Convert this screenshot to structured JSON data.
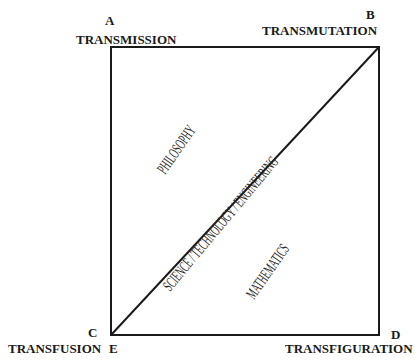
{
  "corners": {
    "A": {
      "letter": "A",
      "label": "TRANSMISSION"
    },
    "B": {
      "letter": "B",
      "label": "TRANSMUTATION"
    },
    "C": {
      "letter": "C",
      "label": "TRANSFUSION",
      "extra": "E"
    },
    "D": {
      "letter": "D",
      "label": "TRANSFIGURATION"
    }
  },
  "regions": {
    "upper": "PHILOSOPHY",
    "diagonal": "SCIENCE / TECHNOLOGY / ENGINEERING",
    "lower": "MATHEMATICS"
  },
  "footer_fragment": "Tr..."
}
